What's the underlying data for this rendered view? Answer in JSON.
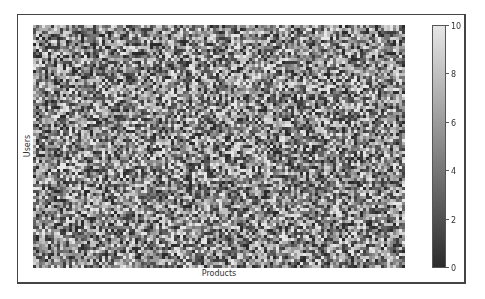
{
  "chart_data": {
    "type": "heatmap",
    "title": "",
    "xlabel": "Products",
    "ylabel": "Users",
    "colormap": "gray",
    "value_range": [
      0,
      10
    ],
    "grid_shape": {
      "rows": 81,
      "cols": 124
    },
    "distribution": "uniform random integers 0-10",
    "colorbar": {
      "ticks": [
        0,
        2,
        4,
        6,
        8,
        10
      ],
      "tick_labels": [
        "0",
        "2",
        "4",
        "6",
        "8",
        "10"
      ],
      "position": "right"
    },
    "colors": {
      "low": "#2b2b2b",
      "high": "#e6e6e6"
    }
  },
  "labels": {
    "xlabel": "Products",
    "ylabel": "Users",
    "ticks": [
      "0",
      "2",
      "4",
      "6",
      "8",
      "10"
    ]
  }
}
